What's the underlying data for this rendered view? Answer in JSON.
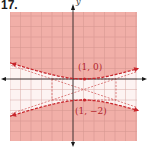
{
  "problem": {
    "number": "17."
  },
  "axes": {
    "y_label": "y"
  },
  "colors": {
    "shade": "#f0aba3",
    "grid": "#c98a84",
    "curve": "#c8252b",
    "asymptote": "#d05050",
    "axis": "#1a1a1a"
  },
  "chart_data": {
    "type": "line",
    "title": "17.",
    "xlabel": "x",
    "ylabel": "y",
    "xlim": [
      -6,
      6
    ],
    "ylim": [
      -6,
      6
    ],
    "grid": true,
    "center": [
      1,
      -1
    ],
    "vertices": [
      [
        1,
        0
      ],
      [
        1,
        -2
      ]
    ],
    "asymptotes": [
      "y + 1 = (x - 1)/3",
      "y + 1 = -(x - 1)/3"
    ],
    "auxiliary_rectangle": {
      "x": [
        -2,
        4
      ],
      "y": [
        -2,
        0
      ]
    },
    "boundary_style": "dashed",
    "shaded_region": "above upper branch and below lower branch",
    "annotations": [
      {
        "text": "(1, 0)",
        "x": 1,
        "y": 0
      },
      {
        "text": "(1, −2)",
        "x": 1,
        "y": -2
      }
    ]
  },
  "labels": {
    "upper_vertex": "(1, 0)",
    "lower_vertex": "(1, −2)"
  }
}
